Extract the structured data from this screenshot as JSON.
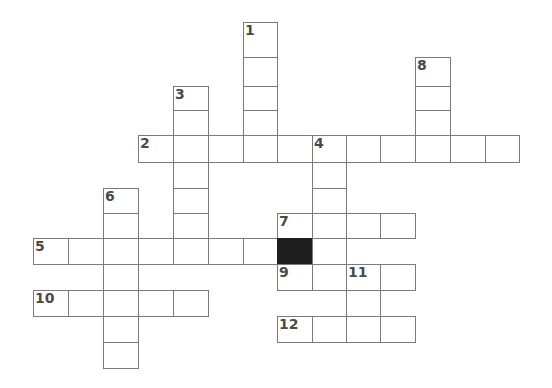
{
  "puzzle": {
    "type": "crossword",
    "colors": {
      "cell_border": "#7a7a7a",
      "cell_fill": "#ffffff",
      "block_fill": "#1e1e1e",
      "number_color": "#4a4a4a"
    },
    "columns_x": [
      33,
      68,
      103,
      138,
      173,
      208,
      243,
      277,
      312,
      346,
      380,
      415,
      450,
      485,
      519
    ],
    "rows_y": [
      22,
      57,
      86,
      110,
      135,
      162,
      188,
      213,
      238,
      264,
      290,
      316,
      342,
      368
    ],
    "cells": [
      {
        "c": 6,
        "r": 0,
        "num": "1"
      },
      {
        "c": 6,
        "r": 1
      },
      {
        "c": 6,
        "r": 2
      },
      {
        "c": 6,
        "r": 3
      },
      {
        "c": 11,
        "r": 1,
        "num": "8"
      },
      {
        "c": 11,
        "r": 2
      },
      {
        "c": 11,
        "r": 3
      },
      {
        "c": 4,
        "r": 2,
        "num": "3"
      },
      {
        "c": 4,
        "r": 3
      },
      {
        "c": 3,
        "r": 4,
        "num": "2"
      },
      {
        "c": 4,
        "r": 4
      },
      {
        "c": 5,
        "r": 4
      },
      {
        "c": 6,
        "r": 4
      },
      {
        "c": 7,
        "r": 4
      },
      {
        "c": 8,
        "r": 4,
        "num": "4"
      },
      {
        "c": 9,
        "r": 4
      },
      {
        "c": 10,
        "r": 4
      },
      {
        "c": 11,
        "r": 4
      },
      {
        "c": 12,
        "r": 4
      },
      {
        "c": 13,
        "r": 4
      },
      {
        "c": 4,
        "r": 5
      },
      {
        "c": 8,
        "r": 5
      },
      {
        "c": 2,
        "r": 6,
        "num": "6"
      },
      {
        "c": 4,
        "r": 6
      },
      {
        "c": 8,
        "r": 6
      },
      {
        "c": 4,
        "r": 7
      },
      {
        "c": 2,
        "r": 7
      },
      {
        "c": 7,
        "r": 7,
        "num": "7"
      },
      {
        "c": 8,
        "r": 7
      },
      {
        "c": 9,
        "r": 7
      },
      {
        "c": 10,
        "r": 7
      },
      {
        "c": 0,
        "r": 8,
        "num": "5"
      },
      {
        "c": 1,
        "r": 8
      },
      {
        "c": 2,
        "r": 8
      },
      {
        "c": 3,
        "r": 8
      },
      {
        "c": 4,
        "r": 8
      },
      {
        "c": 5,
        "r": 8
      },
      {
        "c": 6,
        "r": 8
      },
      {
        "c": 7,
        "r": 8,
        "black": true
      },
      {
        "c": 8,
        "r": 8
      },
      {
        "c": 2,
        "r": 9
      },
      {
        "c": 7,
        "r": 9,
        "num": "9"
      },
      {
        "c": 8,
        "r": 9
      },
      {
        "c": 9,
        "r": 9,
        "num": "11"
      },
      {
        "c": 10,
        "r": 9
      },
      {
        "c": 0,
        "r": 10,
        "num": "10"
      },
      {
        "c": 1,
        "r": 10
      },
      {
        "c": 2,
        "r": 10
      },
      {
        "c": 3,
        "r": 10
      },
      {
        "c": 4,
        "r": 10
      },
      {
        "c": 9,
        "r": 10
      },
      {
        "c": 2,
        "r": 11
      },
      {
        "c": 7,
        "r": 11,
        "num": "12"
      },
      {
        "c": 8,
        "r": 11
      },
      {
        "c": 9,
        "r": 11
      },
      {
        "c": 10,
        "r": 11
      },
      {
        "c": 2,
        "r": 12
      }
    ],
    "clue_numbers": [
      "1",
      "2",
      "3",
      "4",
      "5",
      "6",
      "7",
      "8",
      "9",
      "10",
      "11",
      "12"
    ]
  }
}
